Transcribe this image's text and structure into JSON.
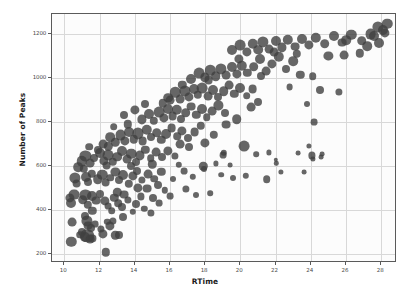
{
  "chart_data": {
    "type": "scatter",
    "title": "",
    "xlabel": "RTime",
    "ylabel": "Number of Peaks",
    "xlim": [
      9.3,
      28.9
    ],
    "ylim": [
      160,
      1290
    ],
    "xticks": [
      10,
      12,
      14,
      16,
      18,
      20,
      22,
      24,
      26,
      28
    ],
    "yticks": [
      200,
      400,
      600,
      800,
      1000,
      1200
    ],
    "grid": true,
    "legend": null,
    "marker_color": "#404040",
    "marker_opacity": 0.8,
    "background_color": "#fcfcfc",
    "gridline_color": "#d8d8d8",
    "axis_color": "#5a5a5a",
    "size_encoding": "marker area varies per point",
    "points": [
      {
        "x": 10.4,
        "y": 255,
        "s": 5.2
      },
      {
        "x": 11.2,
        "y": 276,
        "s": 5.0
      },
      {
        "x": 11.3,
        "y": 283,
        "s": 6.8
      },
      {
        "x": 11.45,
        "y": 268,
        "s": 4.4
      },
      {
        "x": 11.6,
        "y": 272,
        "s": 3.6
      },
      {
        "x": 12.35,
        "y": 208,
        "s": 4.2
      },
      {
        "x": 13.1,
        "y": 288,
        "s": 4.0
      },
      {
        "x": 10.45,
        "y": 345,
        "s": 4.4
      },
      {
        "x": 11.15,
        "y": 372,
        "s": 4.0
      },
      {
        "x": 11.3,
        "y": 350,
        "s": 5.6
      },
      {
        "x": 11.35,
        "y": 330,
        "s": 4.4
      },
      {
        "x": 11.5,
        "y": 318,
        "s": 4.0
      },
      {
        "x": 11.75,
        "y": 338,
        "s": 3.4
      },
      {
        "x": 12.1,
        "y": 316,
        "s": 3.6
      },
      {
        "x": 12.45,
        "y": 348,
        "s": 3.2
      },
      {
        "x": 12.6,
        "y": 330,
        "s": 4.6
      },
      {
        "x": 12.75,
        "y": 352,
        "s": 3.6
      },
      {
        "x": 13.35,
        "y": 368,
        "s": 4.0
      },
      {
        "x": 10.3,
        "y": 455,
        "s": 4.6
      },
      {
        "x": 10.4,
        "y": 432,
        "s": 5.0
      },
      {
        "x": 10.55,
        "y": 470,
        "s": 5.4
      },
      {
        "x": 11.05,
        "y": 448,
        "s": 4.8
      },
      {
        "x": 11.2,
        "y": 470,
        "s": 5.6
      },
      {
        "x": 11.35,
        "y": 425,
        "s": 4.2
      },
      {
        "x": 11.6,
        "y": 462,
        "s": 5.0
      },
      {
        "x": 11.8,
        "y": 443,
        "s": 4.4
      },
      {
        "x": 12.0,
        "y": 472,
        "s": 4.0
      },
      {
        "x": 12.3,
        "y": 440,
        "s": 4.6
      },
      {
        "x": 12.5,
        "y": 418,
        "s": 3.4
      },
      {
        "x": 12.85,
        "y": 455,
        "s": 4.2
      },
      {
        "x": 13.05,
        "y": 432,
        "s": 3.8
      },
      {
        "x": 13.4,
        "y": 470,
        "s": 4.4
      },
      {
        "x": 13.6,
        "y": 448,
        "s": 3.6
      },
      {
        "x": 14.05,
        "y": 430,
        "s": 4.0
      },
      {
        "x": 14.35,
        "y": 462,
        "s": 3.6
      },
      {
        "x": 14.55,
        "y": 405,
        "s": 3.2
      },
      {
        "x": 15.05,
        "y": 455,
        "s": 4.0
      },
      {
        "x": 15.4,
        "y": 432,
        "s": 3.4
      },
      {
        "x": 10.6,
        "y": 545,
        "s": 5.6
      },
      {
        "x": 10.7,
        "y": 520,
        "s": 4.4
      },
      {
        "x": 11.25,
        "y": 552,
        "s": 5.0
      },
      {
        "x": 11.35,
        "y": 528,
        "s": 4.0
      },
      {
        "x": 11.55,
        "y": 565,
        "s": 4.2
      },
      {
        "x": 11.9,
        "y": 540,
        "s": 4.8
      },
      {
        "x": 12.15,
        "y": 560,
        "s": 5.2
      },
      {
        "x": 12.35,
        "y": 525,
        "s": 4.4
      },
      {
        "x": 12.6,
        "y": 548,
        "s": 3.8
      },
      {
        "x": 12.9,
        "y": 572,
        "s": 4.6
      },
      {
        "x": 13.1,
        "y": 535,
        "s": 4.0
      },
      {
        "x": 13.35,
        "y": 558,
        "s": 5.0
      },
      {
        "x": 13.65,
        "y": 520,
        "s": 4.2
      },
      {
        "x": 13.9,
        "y": 555,
        "s": 4.6
      },
      {
        "x": 14.15,
        "y": 578,
        "s": 4.0
      },
      {
        "x": 14.4,
        "y": 538,
        "s": 3.6
      },
      {
        "x": 14.75,
        "y": 565,
        "s": 4.4
      },
      {
        "x": 15.1,
        "y": 542,
        "s": 3.8
      },
      {
        "x": 15.5,
        "y": 575,
        "s": 4.2
      },
      {
        "x": 11.0,
        "y": 622,
        "s": 5.2
      },
      {
        "x": 11.2,
        "y": 645,
        "s": 5.6
      },
      {
        "x": 11.45,
        "y": 612,
        "s": 4.4
      },
      {
        "x": 11.7,
        "y": 638,
        "s": 4.0
      },
      {
        "x": 12.0,
        "y": 660,
        "s": 5.0
      },
      {
        "x": 12.25,
        "y": 625,
        "s": 4.6
      },
      {
        "x": 12.5,
        "y": 650,
        "s": 5.4
      },
      {
        "x": 12.75,
        "y": 618,
        "s": 4.2
      },
      {
        "x": 13.0,
        "y": 642,
        "s": 4.8
      },
      {
        "x": 13.3,
        "y": 668,
        "s": 5.0
      },
      {
        "x": 13.55,
        "y": 630,
        "s": 4.4
      },
      {
        "x": 13.8,
        "y": 655,
        "s": 5.2
      },
      {
        "x": 14.05,
        "y": 620,
        "s": 4.0
      },
      {
        "x": 14.3,
        "y": 648,
        "s": 4.6
      },
      {
        "x": 14.6,
        "y": 675,
        "s": 4.2
      },
      {
        "x": 14.9,
        "y": 635,
        "s": 3.8
      },
      {
        "x": 15.2,
        "y": 662,
        "s": 4.4
      },
      {
        "x": 15.55,
        "y": 640,
        "s": 4.0
      },
      {
        "x": 15.9,
        "y": 668,
        "s": 4.6
      },
      {
        "x": 16.3,
        "y": 645,
        "s": 3.6
      },
      {
        "x": 12.2,
        "y": 700,
        "s": 4.4
      },
      {
        "x": 12.6,
        "y": 730,
        "s": 4.8
      },
      {
        "x": 12.9,
        "y": 708,
        "s": 4.2
      },
      {
        "x": 13.2,
        "y": 742,
        "s": 5.4
      },
      {
        "x": 13.45,
        "y": 715,
        "s": 4.6
      },
      {
        "x": 13.7,
        "y": 755,
        "s": 5.0
      },
      {
        "x": 13.95,
        "y": 722,
        "s": 4.2
      },
      {
        "x": 14.2,
        "y": 748,
        "s": 5.6
      },
      {
        "x": 14.45,
        "y": 712,
        "s": 4.4
      },
      {
        "x": 14.7,
        "y": 765,
        "s": 5.2
      },
      {
        "x": 14.95,
        "y": 730,
        "s": 4.0
      },
      {
        "x": 15.25,
        "y": 752,
        "s": 4.8
      },
      {
        "x": 15.5,
        "y": 718,
        "s": 4.2
      },
      {
        "x": 15.8,
        "y": 745,
        "s": 5.0
      },
      {
        "x": 16.1,
        "y": 772,
        "s": 4.4
      },
      {
        "x": 16.4,
        "y": 735,
        "s": 3.8
      },
      {
        "x": 16.7,
        "y": 760,
        "s": 4.6
      },
      {
        "x": 17.0,
        "y": 728,
        "s": 4.0
      },
      {
        "x": 17.4,
        "y": 755,
        "s": 4.4
      },
      {
        "x": 17.75,
        "y": 782,
        "s": 4.2
      },
      {
        "x": 14.4,
        "y": 812,
        "s": 4.6
      },
      {
        "x": 14.8,
        "y": 838,
        "s": 5.0
      },
      {
        "x": 15.1,
        "y": 805,
        "s": 4.2
      },
      {
        "x": 15.4,
        "y": 845,
        "s": 5.4
      },
      {
        "x": 15.65,
        "y": 818,
        "s": 4.6
      },
      {
        "x": 15.9,
        "y": 860,
        "s": 5.0
      },
      {
        "x": 16.15,
        "y": 828,
        "s": 4.4
      },
      {
        "x": 16.4,
        "y": 855,
        "s": 5.2
      },
      {
        "x": 16.65,
        "y": 812,
        "s": 4.0
      },
      {
        "x": 16.9,
        "y": 842,
        "s": 4.8
      },
      {
        "x": 17.2,
        "y": 870,
        "s": 4.4
      },
      {
        "x": 17.5,
        "y": 832,
        "s": 4.2
      },
      {
        "x": 17.8,
        "y": 858,
        "s": 5.0
      },
      {
        "x": 18.1,
        "y": 822,
        "s": 3.8
      },
      {
        "x": 18.4,
        "y": 848,
        "s": 4.4
      },
      {
        "x": 18.75,
        "y": 875,
        "s": 4.6
      },
      {
        "x": 19.1,
        "y": 840,
        "s": 4.0
      },
      {
        "x": 15.9,
        "y": 910,
        "s": 4.8
      },
      {
        "x": 16.3,
        "y": 935,
        "s": 5.2
      },
      {
        "x": 16.6,
        "y": 905,
        "s": 4.4
      },
      {
        "x": 16.85,
        "y": 942,
        "s": 5.6
      },
      {
        "x": 17.1,
        "y": 915,
        "s": 4.6
      },
      {
        "x": 17.35,
        "y": 950,
        "s": 5.0
      },
      {
        "x": 17.6,
        "y": 922,
        "s": 4.2
      },
      {
        "x": 17.85,
        "y": 955,
        "s": 5.4
      },
      {
        "x": 18.15,
        "y": 918,
        "s": 4.4
      },
      {
        "x": 18.45,
        "y": 945,
        "s": 5.0
      },
      {
        "x": 18.75,
        "y": 912,
        "s": 4.0
      },
      {
        "x": 19.05,
        "y": 940,
        "s": 4.8
      },
      {
        "x": 19.35,
        "y": 968,
        "s": 4.4
      },
      {
        "x": 19.65,
        "y": 928,
        "s": 4.2
      },
      {
        "x": 20.0,
        "y": 955,
        "s": 5.0
      },
      {
        "x": 20.35,
        "y": 920,
        "s": 3.8
      },
      {
        "x": 20.7,
        "y": 948,
        "s": 4.4
      },
      {
        "x": 17.2,
        "y": 995,
        "s": 5.0
      },
      {
        "x": 17.65,
        "y": 1020,
        "s": 5.4
      },
      {
        "x": 18.0,
        "y": 1002,
        "s": 4.6
      },
      {
        "x": 18.3,
        "y": 1035,
        "s": 5.2
      },
      {
        "x": 18.6,
        "y": 1008,
        "s": 4.8
      },
      {
        "x": 18.9,
        "y": 1042,
        "s": 5.6
      },
      {
        "x": 19.2,
        "y": 1012,
        "s": 4.4
      },
      {
        "x": 19.5,
        "y": 1048,
        "s": 5.0
      },
      {
        "x": 19.8,
        "y": 1018,
        "s": 4.6
      },
      {
        "x": 20.1,
        "y": 1055,
        "s": 5.2
      },
      {
        "x": 20.4,
        "y": 1022,
        "s": 4.2
      },
      {
        "x": 20.75,
        "y": 1050,
        "s": 4.8
      },
      {
        "x": 21.1,
        "y": 1085,
        "s": 5.0
      },
      {
        "x": 21.45,
        "y": 1030,
        "s": 4.4
      },
      {
        "x": 21.8,
        "y": 1062,
        "s": 4.6
      },
      {
        "x": 22.2,
        "y": 1095,
        "s": 5.2
      },
      {
        "x": 22.6,
        "y": 1040,
        "s": 4.0
      },
      {
        "x": 23.0,
        "y": 1075,
        "s": 4.8
      },
      {
        "x": 19.5,
        "y": 1125,
        "s": 5.0
      },
      {
        "x": 20.0,
        "y": 1148,
        "s": 5.4
      },
      {
        "x": 20.35,
        "y": 1118,
        "s": 4.6
      },
      {
        "x": 20.7,
        "y": 1155,
        "s": 5.2
      },
      {
        "x": 21.0,
        "y": 1128,
        "s": 4.8
      },
      {
        "x": 21.3,
        "y": 1162,
        "s": 5.6
      },
      {
        "x": 21.65,
        "y": 1132,
        "s": 4.4
      },
      {
        "x": 22.0,
        "y": 1168,
        "s": 5.0
      },
      {
        "x": 22.35,
        "y": 1138,
        "s": 4.6
      },
      {
        "x": 22.7,
        "y": 1172,
        "s": 5.2
      },
      {
        "x": 23.1,
        "y": 1142,
        "s": 4.4
      },
      {
        "x": 23.5,
        "y": 1178,
        "s": 5.0
      },
      {
        "x": 23.9,
        "y": 1148,
        "s": 4.6
      },
      {
        "x": 24.3,
        "y": 1182,
        "s": 5.2
      },
      {
        "x": 24.8,
        "y": 1155,
        "s": 4.8
      },
      {
        "x": 25.3,
        "y": 1188,
        "s": 5.0
      },
      {
        "x": 25.8,
        "y": 1160,
        "s": 4.4
      },
      {
        "x": 26.3,
        "y": 1195,
        "s": 5.2
      },
      {
        "x": 26.9,
        "y": 1168,
        "s": 4.8
      },
      {
        "x": 27.4,
        "y": 1200,
        "s": 5.4
      },
      {
        "x": 27.8,
        "y": 1232,
        "s": 5.6
      },
      {
        "x": 28.1,
        "y": 1218,
        "s": 5.0
      },
      {
        "x": 28.35,
        "y": 1245,
        "s": 5.2
      },
      {
        "x": 21.2,
        "y": 1010,
        "s": 4.0
      },
      {
        "x": 23.4,
        "y": 1015,
        "s": 4.2
      },
      {
        "x": 24.1,
        "y": 1008,
        "s": 3.8
      },
      {
        "x": 25.0,
        "y": 1098,
        "s": 4.6
      },
      {
        "x": 25.9,
        "y": 1105,
        "s": 4.4
      },
      {
        "x": 26.8,
        "y": 1112,
        "s": 4.2
      },
      {
        "x": 27.2,
        "y": 1145,
        "s": 4.8
      },
      {
        "x": 27.9,
        "y": 1158,
        "s": 5.0
      },
      {
        "x": 24.5,
        "y": 945,
        "s": 4.0
      },
      {
        "x": 25.6,
        "y": 938,
        "s": 3.6
      },
      {
        "x": 22.8,
        "y": 960,
        "s": 3.4
      },
      {
        "x": 23.8,
        "y": 880,
        "s": 3.0
      },
      {
        "x": 24.2,
        "y": 800,
        "s": 3.4
      },
      {
        "x": 20.2,
        "y": 690,
        "s": 5.4
      },
      {
        "x": 19.0,
        "y": 648,
        "s": 3.4
      },
      {
        "x": 19.05,
        "y": 660,
        "s": 3.2
      },
      {
        "x": 18.6,
        "y": 612,
        "s": 2.6
      },
      {
        "x": 19.4,
        "y": 605,
        "s": 2.4
      },
      {
        "x": 20.9,
        "y": 655,
        "s": 2.8
      },
      {
        "x": 21.6,
        "y": 662,
        "s": 2.6
      },
      {
        "x": 22.0,
        "y": 628,
        "s": 2.2
      },
      {
        "x": 22.05,
        "y": 612,
        "s": 2.2
      },
      {
        "x": 23.3,
        "y": 658,
        "s": 2.4
      },
      {
        "x": 23.9,
        "y": 690,
        "s": 2.6
      },
      {
        "x": 24.05,
        "y": 648,
        "s": 3.6
      },
      {
        "x": 24.1,
        "y": 632,
        "s": 2.6
      },
      {
        "x": 24.6,
        "y": 640,
        "s": 2.4
      },
      {
        "x": 24.65,
        "y": 655,
        "s": 2.4
      },
      {
        "x": 22.3,
        "y": 575,
        "s": 2.6
      },
      {
        "x": 23.6,
        "y": 572,
        "s": 2.4
      },
      {
        "x": 21.5,
        "y": 540,
        "s": 3.8
      },
      {
        "x": 20.3,
        "y": 555,
        "s": 3.2
      },
      {
        "x": 19.6,
        "y": 545,
        "s": 3.0
      },
      {
        "x": 18.9,
        "y": 560,
        "s": 2.8
      },
      {
        "x": 17.9,
        "y": 598,
        "s": 4.2
      },
      {
        "x": 17.95,
        "y": 585,
        "s": 3.0
      },
      {
        "x": 17.3,
        "y": 552,
        "s": 3.2
      },
      {
        "x": 16.8,
        "y": 578,
        "s": 3.4
      },
      {
        "x": 16.2,
        "y": 540,
        "s": 3.0
      },
      {
        "x": 16.5,
        "y": 605,
        "s": 3.2
      },
      {
        "x": 17.5,
        "y": 470,
        "s": 3.0
      },
      {
        "x": 16.0,
        "y": 465,
        "s": 3.4
      },
      {
        "x": 15.7,
        "y": 490,
        "s": 3.2
      },
      {
        "x": 18.3,
        "y": 478,
        "s": 2.8
      },
      {
        "x": 14.9,
        "y": 388,
        "s": 3.6
      },
      {
        "x": 13.9,
        "y": 392,
        "s": 3.2
      },
      {
        "x": 12.9,
        "y": 285,
        "s": 4.2
      },
      {
        "x": 12.2,
        "y": 292,
        "s": 4.6
      },
      {
        "x": 11.0,
        "y": 302,
        "s": 4.0
      },
      {
        "x": 10.9,
        "y": 288,
        "s": 3.8
      },
      {
        "x": 12.7,
        "y": 398,
        "s": 3.8
      },
      {
        "x": 13.3,
        "y": 412,
        "s": 4.0
      },
      {
        "x": 11.6,
        "y": 398,
        "s": 4.2
      },
      {
        "x": 14.7,
        "y": 498,
        "s": 4.4
      },
      {
        "x": 15.3,
        "y": 512,
        "s": 4.0
      },
      {
        "x": 16.9,
        "y": 498,
        "s": 3.6
      },
      {
        "x": 13.0,
        "y": 480,
        "s": 4.2
      },
      {
        "x": 14.2,
        "y": 502,
        "s": 4.6
      },
      {
        "x": 10.8,
        "y": 595,
        "s": 4.8
      },
      {
        "x": 11.1,
        "y": 588,
        "s": 4.2
      },
      {
        "x": 12.4,
        "y": 602,
        "s": 4.4
      },
      {
        "x": 13.8,
        "y": 598,
        "s": 4.0
      },
      {
        "x": 15.0,
        "y": 608,
        "s": 4.2
      },
      {
        "x": 16.6,
        "y": 700,
        "s": 4.4
      },
      {
        "x": 17.1,
        "y": 688,
        "s": 4.0
      },
      {
        "x": 18.0,
        "y": 705,
        "s": 4.6
      },
      {
        "x": 18.5,
        "y": 742,
        "s": 4.2
      },
      {
        "x": 19.2,
        "y": 788,
        "s": 4.4
      },
      {
        "x": 19.8,
        "y": 812,
        "s": 4.8
      },
      {
        "x": 20.6,
        "y": 868,
        "s": 4.4
      },
      {
        "x": 21.0,
        "y": 892,
        "s": 4.0
      },
      {
        "x": 15.6,
        "y": 885,
        "s": 4.2
      },
      {
        "x": 16.0,
        "y": 900,
        "s": 4.4
      },
      {
        "x": 14.6,
        "y": 882,
        "s": 4.0
      },
      {
        "x": 13.6,
        "y": 790,
        "s": 4.2
      },
      {
        "x": 12.8,
        "y": 778,
        "s": 3.8
      },
      {
        "x": 14.0,
        "y": 855,
        "s": 4.6
      },
      {
        "x": 13.4,
        "y": 830,
        "s": 4.0
      },
      {
        "x": 12.5,
        "y": 690,
        "s": 4.2
      },
      {
        "x": 11.9,
        "y": 672,
        "s": 4.0
      },
      {
        "x": 11.4,
        "y": 688,
        "s": 3.8
      },
      {
        "x": 18.2,
        "y": 990,
        "s": 4.4
      },
      {
        "x": 16.7,
        "y": 970,
        "s": 4.2
      },
      {
        "x": 19.9,
        "y": 1088,
        "s": 4.6
      },
      {
        "x": 21.9,
        "y": 1118,
        "s": 4.4
      },
      {
        "x": 23.2,
        "y": 1108,
        "s": 4.2
      },
      {
        "x": 26.0,
        "y": 1172,
        "s": 4.8
      },
      {
        "x": 27.6,
        "y": 1188,
        "s": 5.0
      },
      {
        "x": 28.2,
        "y": 1205,
        "s": 4.6
      }
    ]
  },
  "axis": {
    "x_tick_labels": [
      "10",
      "12",
      "14",
      "16",
      "18",
      "20",
      "22",
      "24",
      "26",
      "28"
    ],
    "y_tick_labels": [
      "200",
      "400",
      "600",
      "800",
      "1000",
      "1200"
    ],
    "x_axis_title": "RTime",
    "y_axis_title": "Number of Peaks"
  }
}
